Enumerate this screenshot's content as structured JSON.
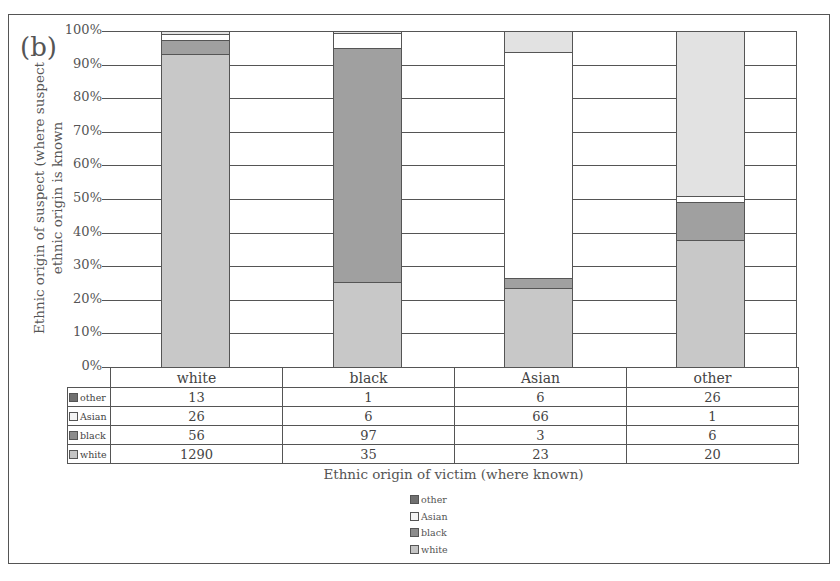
{
  "panel_label": "(b)",
  "chart_data": {
    "type": "bar",
    "stacked": true,
    "normalized_percent": true,
    "title": "",
    "xlabel": "Ethnic origin of victim (where known)",
    "ylabel": "Ethnic origin of suspect (where suspect ethnic origin is known",
    "ylim": [
      0,
      100
    ],
    "yticks": [
      "0%",
      "10%",
      "20%",
      "30%",
      "40%",
      "50%",
      "60%",
      "70%",
      "80%",
      "90%",
      "100%"
    ],
    "grid": true,
    "legend_position": "bottom",
    "categories": [
      "white",
      "black",
      "Asian",
      "other"
    ],
    "series": [
      {
        "name": "white",
        "color": "#c8c8c8",
        "counts": [
          1290,
          35,
          23,
          20
        ],
        "values_pct": [
          93.1,
          25.2,
          23.5,
          37.7
        ]
      },
      {
        "name": "black",
        "color": "#a0a0a0",
        "counts": [
          56,
          97,
          3,
          6
        ],
        "values_pct": [
          4.0,
          69.8,
          3.1,
          11.3
        ]
      },
      {
        "name": "Asian",
        "color": "#ffffff",
        "counts": [
          26,
          6,
          66,
          1
        ],
        "values_pct": [
          1.9,
          4.3,
          67.3,
          1.9
        ]
      },
      {
        "name": "other",
        "color": "#e2e2e2",
        "counts": [
          13,
          1,
          6,
          26
        ],
        "values_pct": [
          0.9,
          0.7,
          6.1,
          49.1
        ]
      }
    ],
    "table": {
      "header": [
        "white",
        "black",
        "Asian",
        "other"
      ],
      "rows": [
        {
          "label": "other",
          "swatch": "#707070",
          "values": [
            "13",
            "1",
            "6",
            "26"
          ]
        },
        {
          "label": "Asian",
          "swatch": "#f4f4f4",
          "values": [
            "26",
            "6",
            "66",
            "1"
          ]
        },
        {
          "label": "black",
          "swatch": "#8c8c8c",
          "values": [
            "56",
            "97",
            "3",
            "6"
          ]
        },
        {
          "label": "white",
          "swatch": "#c4c4c4",
          "values": [
            "1290",
            "35",
            "23",
            "20"
          ]
        }
      ]
    },
    "legend": [
      {
        "label": "other",
        "swatch": "#707070"
      },
      {
        "label": "Asian",
        "swatch": "#f4f4f4"
      },
      {
        "label": "black",
        "swatch": "#8c8c8c"
      },
      {
        "label": "white",
        "swatch": "#c4c4c4"
      }
    ]
  }
}
